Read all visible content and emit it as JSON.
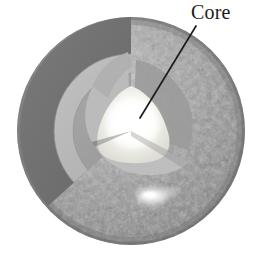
{
  "figure": {
    "type": "cutaway-sphere-diagram",
    "background_color": "#ffffff"
  },
  "labels": [
    {
      "id": "core",
      "text": "Core",
      "x": 191,
      "y": 1,
      "color": "#1a1a1a"
    }
  ],
  "leader_line": {
    "name": "core-leader-line",
    "from_x": 196,
    "from_y": 26,
    "to_x": 140,
    "to_y": 118,
    "color": "#1c1c1c",
    "width": 1.6
  },
  "sphere": {
    "center_x": 131,
    "center_y": 131,
    "radius": 114,
    "surface_color": "#9a9a9a",
    "surface_texture": "granular-mottled",
    "highlight_color": "#f2f2f2"
  },
  "layers": [
    {
      "id": "surface",
      "name": "outer-surface-shell",
      "color": "#9c9c9c",
      "radius_fraction": 1.0
    },
    {
      "id": "shell-dark",
      "name": "cutaway-outer-shell-face",
      "color": "#6e6e6e",
      "radius_fraction": 0.84
    },
    {
      "id": "zone-light",
      "name": "cutaway-mid-layer-face",
      "color": "#b7b7b7",
      "radius_fraction": 0.66
    },
    {
      "id": "zone-mid",
      "name": "cutaway-inner-layer-face",
      "color": "#9d9d9d",
      "radius_fraction": 0.5
    },
    {
      "id": "core",
      "name": "core-region",
      "color": "#f6f6f2",
      "radius_fraction": 0.27
    }
  ],
  "surface_features": [
    {
      "name": "bright-spot-upper-left",
      "x": 47,
      "y": 86,
      "r": 9
    },
    {
      "name": "bright-spot-upper-right",
      "x": 103,
      "y": 86,
      "r": 4
    },
    {
      "name": "bright-spot-lower",
      "x": 152,
      "y": 196,
      "r": 11
    },
    {
      "name": "bright-spot-lower-right",
      "x": 168,
      "y": 193,
      "r": 5
    }
  ],
  "colors": {
    "ink": "#1a1a1a",
    "paper": "#ffffff",
    "gray_dark": "#5d5d5d",
    "gray_mid": "#8f8f8f",
    "gray_light": "#c2c2c2",
    "core_bright": "#fbfbf7"
  }
}
